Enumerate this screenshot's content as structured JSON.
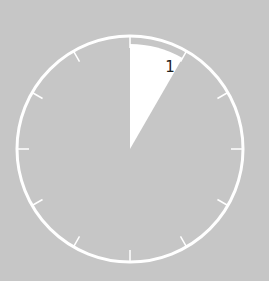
{
  "timer": {
    "center": [
      130,
      149
    ],
    "radius": 113,
    "ring_color": "#ffffff",
    "background_color": "#c6c6c6",
    "wedge_color": "#ffffff",
    "elapsed_minutes_label": "1",
    "wedge_start_deg": 0,
    "wedge_end_deg": 30,
    "wedge_radius": 105,
    "tick_count": 12
  }
}
